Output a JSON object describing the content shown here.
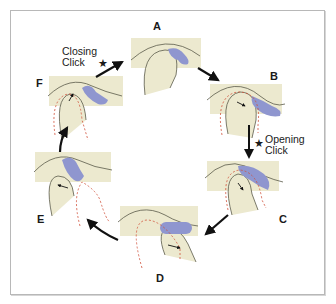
{
  "diagram": {
    "title": "",
    "colors": {
      "bone_fill": "#ece9cf",
      "disc_fill": "#8f96cf",
      "outline": "#5a5a4a",
      "dashed_path": "#d0503a",
      "arrow": "#111111",
      "frame_border": "#b8b8b8"
    },
    "stages": [
      {
        "id": "A",
        "label": "A"
      },
      {
        "id": "B",
        "label": "B"
      },
      {
        "id": "C",
        "label": "C"
      },
      {
        "id": "D",
        "label": "D"
      },
      {
        "id": "E",
        "label": "E"
      },
      {
        "id": "F",
        "label": "F"
      }
    ],
    "annotations": {
      "opening_line1": "Opening",
      "opening_line2": "Click",
      "closing_line1": "Closing",
      "closing_line2": "Click",
      "star_icon": "★"
    },
    "cycle_order": [
      "A",
      "B",
      "C",
      "D",
      "E",
      "F",
      "A"
    ]
  }
}
